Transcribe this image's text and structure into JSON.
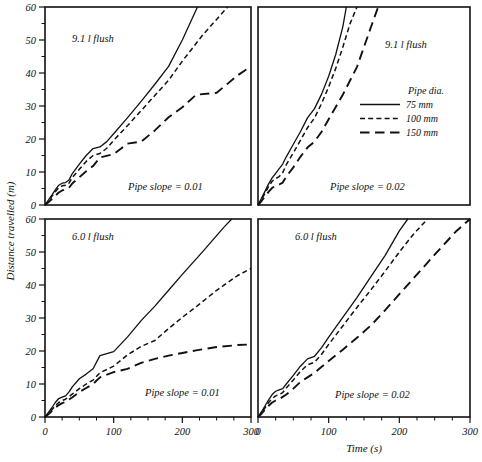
{
  "figure": {
    "width": 482,
    "height": 462,
    "background": "#ffffff",
    "ink_color": "#111111"
  },
  "axes": {
    "y_title": "Distance travelled (m)",
    "x_title": "Time (s)",
    "y_ticks": [
      "0",
      "10",
      "20",
      "30",
      "40",
      "50",
      "60"
    ],
    "x_ticks": [
      "0",
      "100",
      "200",
      "300"
    ]
  },
  "legend": {
    "title": "Pipe dia.",
    "entries": [
      {
        "label": "75 mm",
        "style": "solid"
      },
      {
        "label": "100 mm",
        "style": "short-dash"
      },
      {
        "label": "150 mm",
        "style": "long-dash"
      }
    ]
  },
  "panels": [
    {
      "id": "top-left",
      "flush": "9.1 l flush",
      "slope": "Pipe slope  =  0.01"
    },
    {
      "id": "top-right",
      "flush": "9.1 l flush",
      "slope": "Pipe slope  =  0.02"
    },
    {
      "id": "bottom-left",
      "flush": "6.0 l flush",
      "slope": "Pipe slope  =  0.01"
    },
    {
      "id": "bottom-right",
      "flush": "6.0 l flush",
      "slope": "Pipe slope  =  0.02"
    }
  ],
  "chart_data": {
    "type": "line",
    "title": "",
    "xlabel": "Time (s)",
    "ylabel": "Distance travelled (m)",
    "xlim": [
      0,
      300
    ],
    "ylim": [
      0,
      60
    ],
    "grid": false,
    "legend_position": "top-right-panel-inside",
    "legend_title": "Pipe dia.",
    "panel_layout": "2x2",
    "panels": [
      {
        "id": "top-left",
        "row": 0,
        "col": 0,
        "flush_volume": "9.1 l flush",
        "pipe_slope": "Pipe slope  =  0.01",
        "series": [
          {
            "name": "75 mm",
            "style": "solid",
            "x": [
              0,
              5,
              10,
              15,
              20,
              25,
              30,
              35,
              40,
              50,
              60,
              70,
              80,
              90,
              100,
              120,
              140,
              160,
              180,
              200,
              222
            ],
            "y": [
              0,
              1.5,
              3.0,
              4.6,
              6.0,
              6.6,
              6.8,
              7.6,
              9.6,
              12.4,
              15.0,
              17.1,
              17.6,
              19.2,
              21.6,
              26.4,
              31.4,
              36.6,
              42.0,
              50.0,
              60.0
            ]
          },
          {
            "name": "100 mm",
            "style": "short-dash",
            "x": [
              0,
              5,
              10,
              15,
              20,
              25,
              30,
              35,
              40,
              50,
              60,
              70,
              80,
              90,
              100,
              120,
              140,
              160,
              180,
              200,
              230,
              266
            ],
            "y": [
              0,
              1.2,
              2.6,
              4.0,
              5.2,
              5.8,
              6.0,
              6.6,
              8.4,
              10.8,
              13.2,
              15.0,
              15.6,
              17.2,
              19.6,
              24.0,
              28.6,
              33.2,
              37.8,
              43.6,
              51.6,
              60.0
            ]
          },
          {
            "name": "150 mm",
            "style": "long-dash",
            "x": [
              0,
              5,
              10,
              15,
              20,
              25,
              30,
              35,
              40,
              50,
              60,
              70,
              80,
              100,
              120,
              140,
              160,
              180,
              200,
              220,
              250,
              280,
              300
            ],
            "y": [
              0,
              0.8,
              1.8,
              2.8,
              3.8,
              4.4,
              4.8,
              5.2,
              6.6,
              8.4,
              10.2,
              11.8,
              14.4,
              15.4,
              18.6,
              19.2,
              22.6,
              26.6,
              29.6,
              33.4,
              34.0,
              39.2,
              42.0
            ]
          }
        ]
      },
      {
        "id": "top-right",
        "row": 0,
        "col": 1,
        "flush_volume": "9.1 l flush",
        "pipe_slope": "Pipe slope  =  0.02",
        "series": [
          {
            "name": "75 mm",
            "style": "solid",
            "x": [
              0,
              5,
              10,
              15,
              20,
              25,
              30,
              35,
              40,
              50,
              60,
              70,
              80,
              90,
              100,
              110,
              120,
              125
            ],
            "y": [
              0,
              2.0,
              4.2,
              6.4,
              8.2,
              9.6,
              11.0,
              12.4,
              14.6,
              18.4,
              22.2,
              26.4,
              29.2,
              33.6,
              39.0,
              45.6,
              54.0,
              60.0
            ]
          },
          {
            "name": "100 mm",
            "style": "short-dash",
            "x": [
              0,
              5,
              10,
              15,
              20,
              25,
              30,
              35,
              40,
              50,
              60,
              70,
              80,
              90,
              100,
              110,
              120,
              130,
              140
            ],
            "y": [
              0,
              1.7,
              3.6,
              5.6,
              7.2,
              8.0,
              8.6,
              9.8,
              12.2,
              15.8,
              19.6,
              23.4,
              26.4,
              30.8,
              35.8,
              41.4,
              47.8,
              54.8,
              60.0
            ]
          },
          {
            "name": "150 mm",
            "style": "long-dash",
            "x": [
              0,
              5,
              10,
              15,
              20,
              25,
              30,
              35,
              40,
              50,
              60,
              70,
              80,
              90,
              100,
              120,
              140,
              160,
              170
            ],
            "y": [
              0,
              1.2,
              2.6,
              4.0,
              5.2,
              5.8,
              6.2,
              6.8,
              8.6,
              11.4,
              14.6,
              17.4,
              19.2,
              22.2,
              26.0,
              33.4,
              41.8,
              54.0,
              60.0
            ]
          }
        ]
      },
      {
        "id": "bottom-left",
        "row": 1,
        "col": 0,
        "flush_volume": "6.0 l flush",
        "pipe_slope": "Pipe slope  =  0.01",
        "series": [
          {
            "name": "75 mm",
            "style": "solid",
            "x": [
              0,
              5,
              10,
              15,
              20,
              25,
              30,
              35,
              40,
              50,
              60,
              70,
              80,
              100,
              120,
              140,
              160,
              180,
              200,
              230,
              260,
              272
            ],
            "y": [
              0,
              1.4,
              2.8,
              4.4,
              5.6,
              6.0,
              6.4,
              7.6,
              9.2,
              11.6,
              13.0,
              14.6,
              18.6,
              19.8,
              24.2,
              29.2,
              33.6,
              38.4,
              43.2,
              50.2,
              57.4,
              60.0
            ]
          },
          {
            "name": "100 mm",
            "style": "short-dash",
            "x": [
              0,
              5,
              10,
              15,
              20,
              25,
              30,
              40,
              50,
              60,
              70,
              80,
              100,
              120,
              140,
              160,
              180,
              200,
              220,
              250,
              280,
              300
            ],
            "y": [
              0,
              1.0,
              2.2,
              3.4,
              4.4,
              5.0,
              5.4,
              7.0,
              8.6,
              10.0,
              11.2,
              13.4,
              15.4,
              18.8,
              21.4,
              23.2,
              26.8,
              30.2,
              33.4,
              38.4,
              42.8,
              45.0
            ]
          },
          {
            "name": "150 mm",
            "style": "long-dash",
            "x": [
              0,
              5,
              10,
              15,
              20,
              25,
              30,
              40,
              50,
              60,
              70,
              80,
              100,
              120,
              140,
              160,
              180,
              200,
              220,
              250,
              280,
              300
            ],
            "y": [
              0,
              0.8,
              1.8,
              2.8,
              3.6,
              4.2,
              4.6,
              6.0,
              7.6,
              8.8,
              10.0,
              12.0,
              13.6,
              14.6,
              16.4,
              17.6,
              18.6,
              19.4,
              20.2,
              21.2,
              21.8,
              22.0
            ]
          }
        ]
      },
      {
        "id": "bottom-right",
        "row": 1,
        "col": 1,
        "flush_volume": "6.0 l flush",
        "pipe_slope": "Pipe slope  =  0.02",
        "series": [
          {
            "name": "75 mm",
            "style": "solid",
            "x": [
              0,
              5,
              10,
              15,
              20,
              25,
              30,
              35,
              40,
              50,
              60,
              70,
              80,
              90,
              100,
              120,
              140,
              160,
              180,
              200,
              212
            ],
            "y": [
              0,
              1.6,
              3.4,
              5.2,
              6.8,
              7.8,
              8.2,
              8.6,
              10.0,
              12.6,
              15.4,
              17.6,
              18.4,
              21.0,
              24.2,
              30.2,
              36.2,
              42.6,
              49.0,
              56.4,
              60.0
            ]
          },
          {
            "name": "100 mm",
            "style": "short-dash",
            "x": [
              0,
              5,
              10,
              15,
              20,
              25,
              30,
              35,
              40,
              50,
              60,
              70,
              80,
              90,
              100,
              120,
              140,
              160,
              180,
              200,
              220,
              240
            ],
            "y": [
              0,
              1.3,
              2.8,
              4.4,
              5.6,
              6.4,
              6.8,
              7.4,
              8.8,
              11.2,
              13.8,
              15.8,
              16.6,
              19.0,
              22.0,
              27.6,
              33.2,
              38.6,
              44.2,
              50.0,
              55.4,
              60.0
            ]
          },
          {
            "name": "150 mm",
            "style": "long-dash",
            "x": [
              0,
              5,
              10,
              15,
              20,
              25,
              30,
              40,
              50,
              60,
              70,
              80,
              100,
              120,
              140,
              160,
              180,
              200,
              220,
              250,
              280,
              300
            ],
            "y": [
              0,
              1.0,
              2.2,
              3.4,
              4.4,
              5.0,
              5.4,
              6.8,
              8.6,
              10.6,
              12.0,
              13.4,
              17.0,
              20.4,
              24.0,
              27.8,
              32.4,
              37.2,
              42.0,
              49.2,
              56.2,
              60.0
            ]
          }
        ]
      }
    ]
  }
}
